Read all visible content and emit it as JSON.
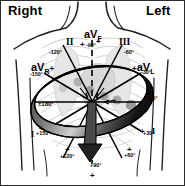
{
  "figure": {
    "orientation": {
      "right_label": "Right",
      "left_label": "Left"
    },
    "colors": {
      "ink": "#000000",
      "band": "#1a1a1a",
      "torso_line": "#3a3a3a",
      "ghost": "#b9b9b9",
      "background": "#ffffff"
    },
    "leads": [
      {
        "name": "II",
        "display": "II",
        "angle_label": "+60°"
      },
      {
        "name": "III",
        "display": "III",
        "angle_label": "+120°"
      },
      {
        "name": "aVR",
        "display": "aV",
        "sub": "R",
        "sign": "+",
        "angle_label": "-150°"
      },
      {
        "name": "aVL",
        "display": "aV",
        "sub": "L",
        "sign": "+",
        "angle_label": "-30°"
      },
      {
        "name": "aVF",
        "display": "aV",
        "sub": "F",
        "sign": "",
        "angle_label": "+90°"
      },
      {
        "name": "I",
        "display": "I",
        "angle_label": "± 0°"
      }
    ],
    "degree_marks": {
      "minus_120": "-120°",
      "minus_90": "-90°",
      "minus_60": "-60°",
      "minus_30": "-30°",
      "minus_150": "-150°",
      "zero": "± 0°",
      "plus_30": "+30°",
      "plus_60": "+60°",
      "plus_90": "+90°",
      "plus_120": "+120°",
      "plus_150": "+150°",
      "plus_minus_180": "±180°"
    },
    "polarity_marks": {
      "p1": "+",
      "p2": "+",
      "p3": "+",
      "p4": "+",
      "p5": "+",
      "p6": "+",
      "p7": "+",
      "p8": "+"
    },
    "lead_markers": {
      "one_left": "I",
      "one_right": "I"
    }
  }
}
